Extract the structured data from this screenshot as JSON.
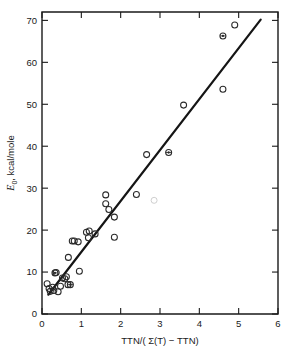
{
  "chart_data": {
    "type": "scatter",
    "title": "",
    "subtitle": "",
    "xlabel": "TTN/( Σ(T) − TTN)",
    "ylabel": "E₀ , kcal/mole",
    "ylabel_symbol": "E",
    "ylabel_subscript": "0",
    "ylabel_rest": ", kcal/mole",
    "xlim": [
      0,
      6
    ],
    "ylim": [
      0,
      72
    ],
    "xticks": [
      0,
      1,
      2,
      3,
      4,
      5,
      6
    ],
    "xtick_labels": [
      "0",
      "1",
      "2",
      "3",
      "4",
      "5",
      "6"
    ],
    "yticks": [
      0,
      10,
      20,
      30,
      40,
      50,
      60,
      70
    ],
    "ytick_labels": [
      "0",
      "10",
      "20",
      "30",
      "40",
      "50",
      "60",
      "70"
    ],
    "grid": false,
    "legend": null,
    "frame": "box",
    "points": [
      {
        "x": 0.13,
        "y": 7.2,
        "marker": "open"
      },
      {
        "x": 0.18,
        "y": 6.1,
        "marker": "open"
      },
      {
        "x": 0.21,
        "y": 5.4,
        "marker": "open"
      },
      {
        "x": 0.27,
        "y": 6.4,
        "marker": "open"
      },
      {
        "x": 0.3,
        "y": 5.6,
        "marker": "open"
      },
      {
        "x": 0.33,
        "y": 9.8,
        "marker": "filled"
      },
      {
        "x": 0.36,
        "y": 9.9,
        "marker": "open"
      },
      {
        "x": 0.41,
        "y": 5.3,
        "marker": "open"
      },
      {
        "x": 0.47,
        "y": 6.6,
        "marker": "open"
      },
      {
        "x": 0.52,
        "y": 8.6,
        "marker": "open"
      },
      {
        "x": 0.58,
        "y": 8.4,
        "marker": "open"
      },
      {
        "x": 0.62,
        "y": 8.9,
        "marker": "open"
      },
      {
        "x": 0.66,
        "y": 7.0,
        "marker": "open"
      },
      {
        "x": 0.72,
        "y": 7.0,
        "marker": "filled"
      },
      {
        "x": 0.67,
        "y": 13.5,
        "marker": "open"
      },
      {
        "x": 0.77,
        "y": 17.4,
        "marker": "open"
      },
      {
        "x": 0.82,
        "y": 17.4,
        "marker": "open"
      },
      {
        "x": 0.92,
        "y": 17.2,
        "marker": "open"
      },
      {
        "x": 0.95,
        "y": 10.2,
        "marker": "open"
      },
      {
        "x": 1.13,
        "y": 19.5,
        "marker": "open"
      },
      {
        "x": 1.18,
        "y": 18.2,
        "marker": "open"
      },
      {
        "x": 1.2,
        "y": 19.8,
        "marker": "open"
      },
      {
        "x": 1.35,
        "y": 19.1,
        "marker": "open"
      },
      {
        "x": 1.62,
        "y": 28.4,
        "marker": "open"
      },
      {
        "x": 1.62,
        "y": 26.3,
        "marker": "open"
      },
      {
        "x": 1.7,
        "y": 24.9,
        "marker": "open"
      },
      {
        "x": 1.84,
        "y": 23.1,
        "marker": "open"
      },
      {
        "x": 1.84,
        "y": 18.3,
        "marker": "open"
      },
      {
        "x": 2.4,
        "y": 28.5,
        "marker": "open"
      },
      {
        "x": 2.66,
        "y": 38.0,
        "marker": "open"
      },
      {
        "x": 2.85,
        "y": 27.1,
        "marker": "faint"
      },
      {
        "x": 3.22,
        "y": 38.5,
        "marker": "filled"
      },
      {
        "x": 3.6,
        "y": 49.8,
        "marker": "open"
      },
      {
        "x": 4.6,
        "y": 53.6,
        "marker": "open"
      },
      {
        "x": 4.6,
        "y": 66.3,
        "marker": "filled"
      },
      {
        "x": 4.9,
        "y": 68.9,
        "marker": "open"
      }
    ],
    "trend_line": {
      "x_start": 0.16,
      "y_start": 4.6,
      "x_end": 5.56,
      "y_end": 70.2
    }
  }
}
